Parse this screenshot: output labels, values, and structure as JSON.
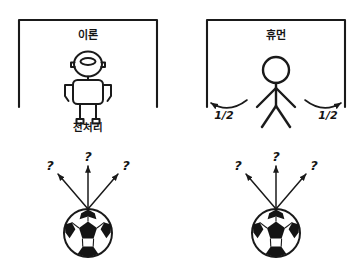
{
  "diagram": {
    "title_visible": false,
    "background_color": "#ffffff",
    "ink_color": "#1a1a1a",
    "panels": [
      {
        "id": "robot-panel",
        "side": "left",
        "goal_label": "이론",
        "keeper_type": "robot",
        "caption": "전처리",
        "probability_labels": [],
        "ball": {
          "label": "",
          "arrows": [
            {
              "direction": "left",
              "label": "?"
            },
            {
              "direction": "up",
              "label": "?"
            },
            {
              "direction": "right",
              "label": "?"
            }
          ]
        }
      },
      {
        "id": "human-panel",
        "side": "right",
        "goal_label": "휴먼",
        "keeper_type": "stick-figure",
        "caption": "",
        "probability_labels": [
          {
            "position": "left",
            "value": "1/2"
          },
          {
            "position": "right",
            "value": "1/2"
          }
        ],
        "ball": {
          "label": "",
          "arrows": [
            {
              "direction": "left",
              "label": "?"
            },
            {
              "direction": "up",
              "label": "?"
            },
            {
              "direction": "right",
              "label": "?"
            }
          ]
        }
      }
    ]
  }
}
